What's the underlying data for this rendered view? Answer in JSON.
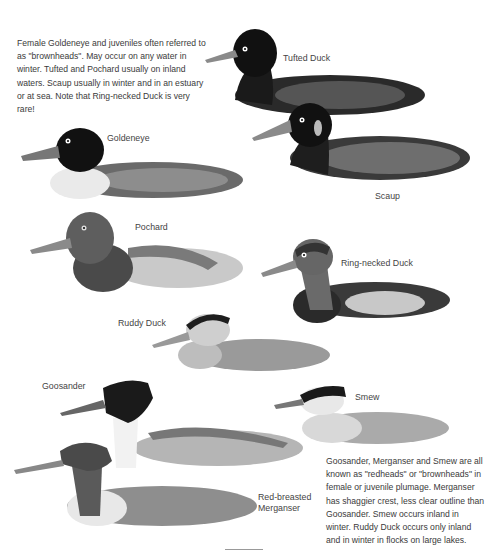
{
  "intro_note": "Female Goldeneye and juveniles often referred to as \"brownheads\". May occur on any water in winter. Tufted and Pochard usually on inland waters. Scaup usually in winter and in an estuary or at sea. Note that Ring-necked Duck is very rare!",
  "bottom_note": "Goosander, Merganser and Smew are all known as \"redheads\" or \"brownheads\" in female or juvenile plumage. Merganser has shaggier crest, less clear outline than Goosander. Smew occurs inland in winter. Ruddy Duck occurs only inland and in winter in flocks on large lakes.",
  "birds": [
    {
      "id": "tufted-duck",
      "label": "Tufted Duck"
    },
    {
      "id": "scaup",
      "label": "Scaup"
    },
    {
      "id": "goldeneye",
      "label": "Goldeneye"
    },
    {
      "id": "pochard",
      "label": "Pochard"
    },
    {
      "id": "ring-necked-duck",
      "label": "Ring-necked Duck"
    },
    {
      "id": "ruddy-duck",
      "label": "Ruddy Duck"
    },
    {
      "id": "goosander",
      "label": "Goosander"
    },
    {
      "id": "smew",
      "label": "Smew"
    },
    {
      "id": "red-breasted-merganser",
      "label": "Red-breasted Merganser",
      "label_lines": [
        "Red-breasted",
        "Merganser"
      ]
    }
  ]
}
